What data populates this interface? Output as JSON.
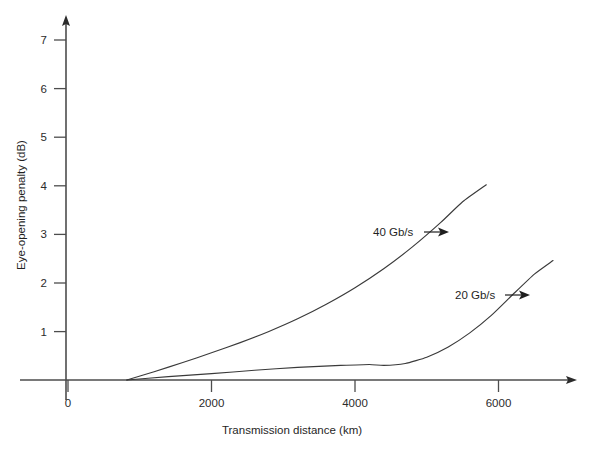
{
  "chart_data": {
    "type": "line",
    "title": "",
    "xlabel": "Transmission distance (km)",
    "ylabel": "Eye-opening penalty (dB)",
    "xlim": [
      0,
      7600
    ],
    "ylim": [
      0,
      7.55
    ],
    "grid": false,
    "legend_position": "inline-annotation",
    "xticks": [
      0,
      2000,
      4000,
      6000
    ],
    "xtick_labels": [
      "0",
      "2000",
      "4000",
      "6000"
    ],
    "yticks": [
      1,
      2,
      3,
      4,
      5,
      6,
      7
    ],
    "ytick_labels": [
      "1",
      "2",
      "3",
      "4",
      "5",
      "6",
      "7"
    ],
    "series": [
      {
        "name": "40 Gb/s",
        "annotation": "40 Gb/s",
        "points": [
          [
            820,
            0.0
          ],
          [
            1200,
            0.17
          ],
          [
            1600,
            0.36
          ],
          [
            2000,
            0.56
          ],
          [
            2400,
            0.77
          ],
          [
            2800,
            1.0
          ],
          [
            3200,
            1.26
          ],
          [
            3600,
            1.56
          ],
          [
            4000,
            1.9
          ],
          [
            4400,
            2.29
          ],
          [
            4800,
            2.74
          ],
          [
            5200,
            3.25
          ],
          [
            5500,
            3.67
          ],
          [
            5830,
            4.02
          ]
        ]
      },
      {
        "name": "20 Gb/s",
        "annotation": "20 Gb/s",
        "points": [
          [
            820,
            0.0
          ],
          [
            1400,
            0.07
          ],
          [
            2000,
            0.13
          ],
          [
            2600,
            0.2
          ],
          [
            3200,
            0.26
          ],
          [
            3800,
            0.3
          ],
          [
            4200,
            0.32
          ],
          [
            4400,
            0.3
          ],
          [
            4700,
            0.34
          ],
          [
            5000,
            0.47
          ],
          [
            5300,
            0.68
          ],
          [
            5600,
            0.97
          ],
          [
            5900,
            1.33
          ],
          [
            6200,
            1.76
          ],
          [
            6500,
            2.18
          ],
          [
            6760,
            2.46
          ]
        ]
      }
    ],
    "annotations": [
      {
        "text": "40 Gb/s",
        "x_px": 373,
        "y_px": 236,
        "arrow_from_px": [
          424,
          232
        ],
        "arrow_to_px": [
          447,
          232
        ]
      },
      {
        "text": "20 Gb/s",
        "x_px": 455,
        "y_px": 299,
        "arrow_from_px": [
          500,
          296
        ],
        "arrow_to_px": [
          523,
          296
        ]
      }
    ],
    "colors": {
      "curve": "#3a3a3a",
      "axis": "#4d4d4d",
      "text": "#1f1f1f",
      "background": "#ffffff"
    }
  }
}
